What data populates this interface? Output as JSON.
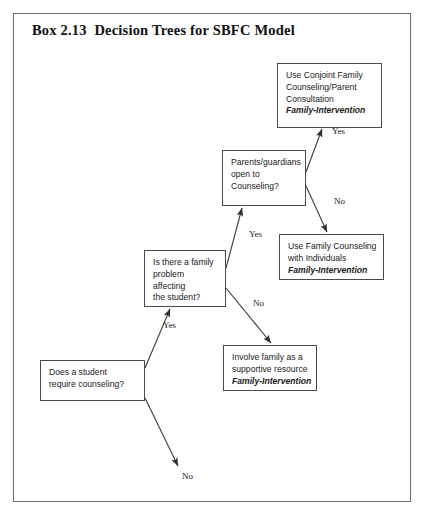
{
  "document": {
    "title": "Box 2.13  Decision Trees for SBFC Model"
  },
  "diagram": {
    "type": "decision-tree",
    "nodes": [
      {
        "id": "conjoint-family-counseling",
        "kind": "outcome",
        "lines": [
          "Use Conjoint Family",
          "Counseling/Parent",
          "Consultation"
        ],
        "emphasis": "Family-Intervention",
        "x": 277,
        "y": 63,
        "w": 105,
        "h": 65
      },
      {
        "id": "parents-open-to-counseling",
        "kind": "decision",
        "lines": [
          "Parents/guardians",
          "open to",
          "Counseling?"
        ],
        "emphasis": "",
        "x": 222,
        "y": 150,
        "w": 84,
        "h": 56
      },
      {
        "id": "family-counseling-individuals",
        "kind": "outcome",
        "lines": [
          "Use Family Counseling",
          "with Individuals"
        ],
        "emphasis": "Family-Intervention",
        "x": 279,
        "y": 234,
        "w": 105,
        "h": 46
      },
      {
        "id": "family-problem-affecting-student",
        "kind": "decision",
        "lines": [
          "Is there a family",
          "problem",
          "affecting",
          "the student?"
        ],
        "emphasis": "",
        "x": 144,
        "y": 250,
        "w": 82,
        "h": 57
      },
      {
        "id": "involve-family-supportive",
        "kind": "outcome",
        "lines": [
          "Involve family as a",
          "supportive resource"
        ],
        "emphasis": "Family-Intervention",
        "x": 223,
        "y": 345,
        "w": 94,
        "h": 46
      },
      {
        "id": "does-student-require-counseling",
        "kind": "decision",
        "lines": [
          "Does a student",
          "require counseling?"
        ],
        "emphasis": "",
        "x": 40,
        "y": 360,
        "w": 105,
        "h": 41
      }
    ],
    "edges": [
      {
        "id": "parents-yes-to-conjoint",
        "from": "parents-open-to-counseling",
        "to": "conjoint-family-counseling",
        "label": "Yes",
        "label_x": 332,
        "label_y": 126,
        "x1": 306,
        "y1": 172,
        "x2": 322,
        "y2": 129
      },
      {
        "id": "parents-no-to-individuals",
        "from": "parents-open-to-counseling",
        "to": "family-counseling-individuals",
        "label": "No",
        "label_x": 334,
        "label_y": 196,
        "x1": 306,
        "y1": 186,
        "x2": 327,
        "y2": 232
      },
      {
        "id": "family-problem-yes-to-parents",
        "from": "family-problem-affecting-student",
        "to": "parents-open-to-counseling",
        "label": "Yes",
        "label_x": 249,
        "label_y": 229,
        "x1": 226,
        "y1": 268,
        "x2": 242,
        "y2": 208
      },
      {
        "id": "family-problem-no-to-involve",
        "from": "family-problem-affecting-student",
        "to": "involve-family-supportive",
        "label": "No",
        "label_x": 253,
        "label_y": 298,
        "x1": 226,
        "y1": 288,
        "x2": 271,
        "y2": 343
      },
      {
        "id": "student-yes-to-family-problem",
        "from": "does-student-require-counseling",
        "to": "family-problem-affecting-student",
        "label": "Yes",
        "label_x": 163,
        "label_y": 320,
        "x1": 145,
        "y1": 368,
        "x2": 170,
        "y2": 309
      },
      {
        "id": "student-no-terminal",
        "from": "does-student-require-counseling",
        "to": "no-terminal",
        "label": "No",
        "label_x": 182,
        "label_y": 471,
        "x1": 145,
        "y1": 398,
        "x2": 178,
        "y2": 466
      }
    ],
    "colors": {
      "frame_border": "#6e6e6e",
      "node_border": "#4a4a4a",
      "edge_stroke": "#3a3a3a",
      "text": "#1a1a1a",
      "background": "#ffffff"
    }
  }
}
